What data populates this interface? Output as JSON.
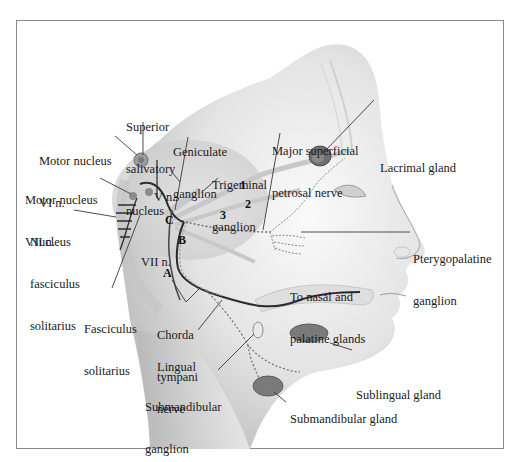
{
  "diagram": {
    "labels": {
      "superior_salivatory_nucleus": [
        "Superior",
        "salivatory",
        "nucleus"
      ],
      "geniculate_ganglion": [
        "Geniculate",
        "ganglion"
      ],
      "major_superficial_petrosal_nerve": [
        "Major superficial",
        "petrosal nerve"
      ],
      "lacrimal_gland": [
        "Lacrimal gland"
      ],
      "motor_nucleus_vi": [
        "Motor nucleus",
        "VI n."
      ],
      "motor_nucleus_vii": [
        "Motor nucleus",
        "VII n."
      ],
      "trigeminal_ganglion": [
        "Trigeminal",
        "ganglion"
      ],
      "v_n": [
        "V n."
      ],
      "nucleus_fasciculus_solitarius": [
        "Nucleus",
        "fasciculus",
        "solitarius"
      ],
      "vii_n": [
        "VII n."
      ],
      "pterygopalatine_ganglion": [
        "Pterygopalatine",
        "ganglion"
      ],
      "to_nasal_palatine_glands": [
        "To nasal and",
        "palatine glands"
      ],
      "fasciculus_solitarius": [
        "Fasciculus",
        "solitarius"
      ],
      "chorda_tympani": [
        "Chorda",
        "tympani"
      ],
      "lingual_nerve": [
        "Lingual",
        "nerve"
      ],
      "sublingual_gland": [
        "Sublingual gland"
      ],
      "submandibular_ganglion": [
        "Submandibular",
        "ganglion"
      ],
      "submandibular_gland": [
        "Submandibular gland"
      ]
    },
    "markers": {
      "A": "A",
      "B": "B",
      "C": "C",
      "n1": "1",
      "n2": "2",
      "n3": "3"
    },
    "colors": {
      "skin_dark": "#bdbdbd",
      "skin_light": "#f2f2f2",
      "nerve": "#2b2b2b",
      "gland": "#6e6e6e",
      "frame": "#8a8a8a"
    }
  }
}
